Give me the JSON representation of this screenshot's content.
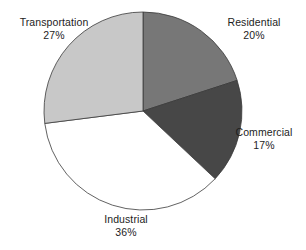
{
  "chart_data": {
    "type": "pie",
    "title": "",
    "subtitle": "",
    "xlabel": "",
    "ylabel": "",
    "legend": "none",
    "grid": false,
    "labels_position": "outside",
    "start_angle_deg": 0,
    "direction": "clockwise",
    "categories": [
      "Residential",
      "Commercial",
      "Industrial",
      "Transportation"
    ],
    "values": [
      20,
      17,
      36,
      27
    ],
    "unit": "%",
    "slices": [
      {
        "name": "Residential",
        "value": 20,
        "value_label": "20%",
        "color": "#777777",
        "start_deg": 0,
        "end_deg": 72
      },
      {
        "name": "Commercial",
        "value": 17,
        "value_label": "17%",
        "color": "#474747",
        "start_deg": 72,
        "end_deg": 133.2
      },
      {
        "name": "Industrial",
        "value": 36,
        "value_label": "36%",
        "color": "#ffffff",
        "start_deg": 133.2,
        "end_deg": 262.8
      },
      {
        "name": "Transportation",
        "value": 27,
        "value_label": "27%",
        "color": "#c8c8c8",
        "start_deg": 262.8,
        "end_deg": 360
      }
    ]
  },
  "labels": {
    "transportation": {
      "name": "Transportation",
      "value": "27%"
    },
    "residential": {
      "name": "Residential",
      "value": "20%"
    },
    "commercial": {
      "name": "Commercial",
      "value": "17%"
    },
    "industrial": {
      "name": "Industrial",
      "value": "36%"
    }
  },
  "geometry": {
    "center_x": 143,
    "center_y": 111,
    "radius": 99,
    "outline_color": "#3a3a3a",
    "outline_width": 0.8
  }
}
